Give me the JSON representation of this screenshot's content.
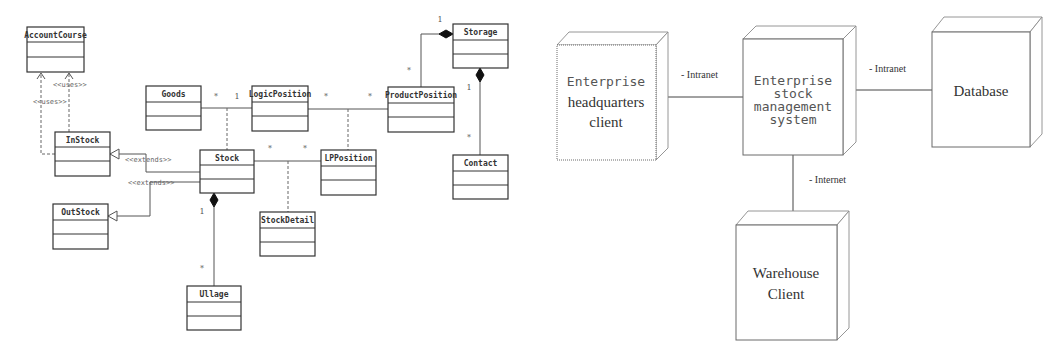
{
  "class_diagram": {
    "classes": {
      "account_course": "AccountCourse",
      "in_stock": "InStock",
      "out_stock": "OutStock",
      "goods": "Goods",
      "logic_position": "LogicPosition",
      "product_position": "ProductPosition",
      "storage": "Storage",
      "stock": "Stock",
      "lp_position": "LPPosition",
      "contact": "Contact",
      "stock_detail": "StockDetail",
      "ullage": "Ullage"
    },
    "stereotypes": {
      "uses_1": "<<uses>>",
      "uses_2": "<<uses>>",
      "extends_1": "<<extends>>",
      "extends_2": "<<extends>>"
    },
    "multiplicities": {
      "goods_logic_star": "*",
      "goods_logic_one": "1",
      "logic_product_star_1": "*",
      "logic_product_star_2": "*",
      "stock_lp_star_1": "*",
      "stock_lp_star_2": "*",
      "storage_product_one": "1",
      "storage_product_star": "*",
      "storage_contact_one": "1",
      "storage_contact_star": "*",
      "stock_ullage_one": "1",
      "stock_ullage_star": "*"
    }
  },
  "deployment_diagram": {
    "nodes": {
      "hq_client": [
        "Enterprise",
        "headquarters",
        "client"
      ],
      "stock_system": [
        "Enterprise",
        "stock",
        "management",
        "system"
      ],
      "database": [
        "Database"
      ],
      "warehouse_client": [
        "Warehouse",
        "Client"
      ]
    },
    "links": {
      "hq_to_system": "- Intranet",
      "system_to_db": "- Intranet",
      "system_to_warehouse": "- Internet"
    }
  }
}
